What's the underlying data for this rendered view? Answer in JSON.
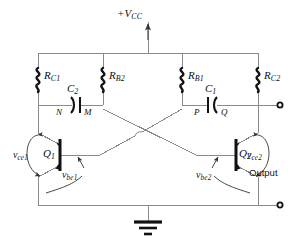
{
  "diagram": {
    "supply": {
      "label": "+V",
      "sub": "CC"
    },
    "resistors": [
      {
        "name": "RC1",
        "label": "R",
        "sub": "C1"
      },
      {
        "name": "RB2",
        "label": "R",
        "sub": "B2"
      },
      {
        "name": "RB1",
        "label": "R",
        "sub": "B1"
      },
      {
        "name": "RC2",
        "label": "R",
        "sub": "C2"
      }
    ],
    "capacitors": [
      {
        "name": "C2",
        "label": "C",
        "sub": "2"
      },
      {
        "name": "C1",
        "label": "C",
        "sub": "1"
      }
    ],
    "nodes": [
      {
        "name": "N",
        "label": "N"
      },
      {
        "name": "M",
        "label": "M"
      },
      {
        "name": "P",
        "label": "P"
      },
      {
        "name": "Q",
        "label": "Q"
      }
    ],
    "transistors": [
      {
        "name": "Q1",
        "label": "Q",
        "sub": "1"
      },
      {
        "name": "Q2",
        "label": "Q",
        "sub": "2"
      }
    ],
    "voltages": [
      {
        "name": "vce1",
        "label": "v",
        "sub": "ce1"
      },
      {
        "name": "vbe1",
        "label": "v",
        "sub": "be1"
      },
      {
        "name": "vbe2",
        "label": "v",
        "sub": "be2"
      },
      {
        "name": "vce2",
        "label": "v",
        "sub": "ce2"
      }
    ],
    "output": {
      "label": "Output"
    },
    "ground": {
      "name": "ground-symbol"
    },
    "terminals": [
      {
        "name": "output-terminal-top"
      },
      {
        "name": "output-terminal-bottom"
      }
    ],
    "colors": {
      "wire": "#7a7a7a",
      "component": "#111111",
      "text": "#111111",
      "background": "#ffffff"
    }
  }
}
